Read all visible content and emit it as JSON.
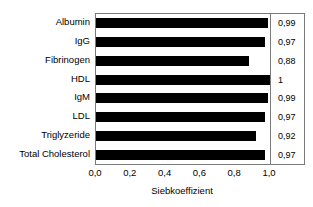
{
  "chart_data": {
    "type": "bar",
    "orientation": "horizontal",
    "title": "",
    "xlabel": "Siebkoeffizient",
    "ylabel": "",
    "xlim": [
      0.0,
      1.0
    ],
    "grid": false,
    "legend": null,
    "bar_color": "#000000",
    "frame_color": "#7a7a7a",
    "categories": [
      "Albumin",
      "IgG",
      "Fibrinogen",
      "HDL",
      "IgM",
      "LDL",
      "Triglyzeride",
      "Total Cholesterol"
    ],
    "values": [
      0.99,
      0.97,
      0.88,
      1.0,
      0.99,
      0.97,
      0.92,
      0.97
    ],
    "value_labels": [
      "0,99",
      "0,97",
      "0,88",
      "1",
      "0,99",
      "0,97",
      "0,92",
      "0,97"
    ],
    "xtick_values": [
      0.0,
      0.2,
      0.4,
      0.6,
      0.8,
      1.0
    ],
    "xtick_labels": [
      "0,0",
      "0,2",
      "0,4",
      "0,6",
      "0,8",
      "1,0"
    ]
  }
}
